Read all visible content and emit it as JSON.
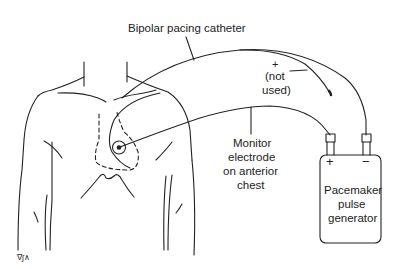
{
  "diagram": {
    "type": "medical-illustration",
    "labels": {
      "catheter": "Bipolar pacing catheter",
      "plus_terminal": "+",
      "not_used_line1": "(not",
      "not_used_line2": "used)",
      "monitor_line1": "Monitor",
      "monitor_line2": "electrode",
      "monitor_line3": "on anterior",
      "monitor_line4": "chest",
      "generator_line1": "Pacemaker",
      "generator_line2": "pulse",
      "generator_line3": "generator",
      "generator_plus": "+",
      "generator_minus": "−"
    },
    "signature": "∇ʃ∧"
  }
}
